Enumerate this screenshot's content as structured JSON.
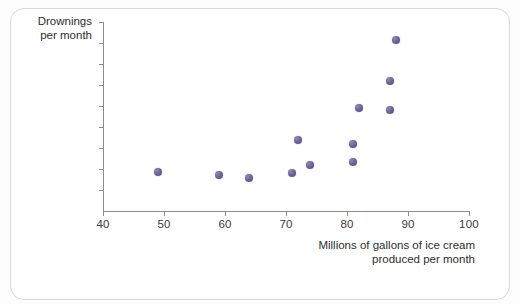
{
  "figure": {
    "y_axis_title_line1": "Drownings",
    "y_axis_title_line2": "per month",
    "x_axis_title_line1": "Millions of gallons of ice cream",
    "x_axis_title_line2": "produced per month",
    "marker_color": "#6f6199",
    "axis_color": "#8d8d8d",
    "text_color": "#2e2e2e",
    "background_color": "#ffffff"
  },
  "chart_data": {
    "type": "scatter",
    "title": "",
    "xlabel": "Millions of gallons of ice cream produced per month",
    "ylabel": "Drownings per month",
    "xlim": [
      40,
      100
    ],
    "ylim": [
      0,
      900
    ],
    "xticks": [
      40,
      50,
      60,
      70,
      80,
      90,
      100
    ],
    "yticks": [
      100,
      200,
      300,
      400,
      500,
      600,
      700,
      800,
      900
    ],
    "grid": false,
    "legend": false,
    "series": [
      {
        "name": "Ice cream vs drownings",
        "color": "#6f6199",
        "points": [
          {
            "x": 49,
            "y": 185
          },
          {
            "x": 59,
            "y": 172
          },
          {
            "x": 64,
            "y": 155
          },
          {
            "x": 71,
            "y": 182
          },
          {
            "x": 72,
            "y": 340
          },
          {
            "x": 74,
            "y": 218
          },
          {
            "x": 81,
            "y": 235
          },
          {
            "x": 81,
            "y": 320
          },
          {
            "x": 82,
            "y": 490
          },
          {
            "x": 87,
            "y": 480
          },
          {
            "x": 87,
            "y": 620
          },
          {
            "x": 88,
            "y": 815
          }
        ]
      }
    ]
  }
}
